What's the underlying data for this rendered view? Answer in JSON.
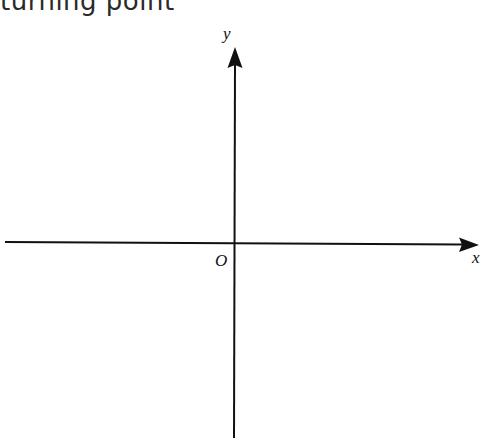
{
  "heading": {
    "text": "turning point",
    "text_note": "uncertain reconstruction — glyphs cropped at top edge, only lower halves visible",
    "legible": false
  },
  "diagram": {
    "type": "cartesian-axes",
    "origin_label": "O",
    "x_axis_label": "x",
    "y_axis_label": "y",
    "origin_px": [
      234,
      242
    ],
    "x_axis_px": {
      "start": [
        5,
        242
      ],
      "end": [
        478,
        245
      ]
    },
    "y_axis_px": {
      "start": [
        234,
        438
      ],
      "end": [
        235,
        47
      ]
    },
    "line_color": "#111111",
    "background": "#ffffff"
  }
}
